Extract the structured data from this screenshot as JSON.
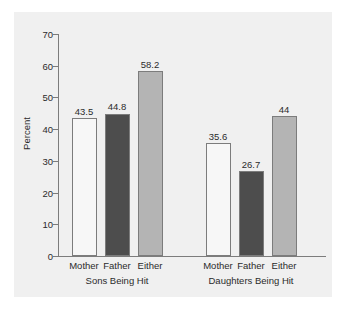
{
  "chart_data": {
    "type": "bar",
    "title": "",
    "subtitle": "",
    "xlabel": "",
    "ylabel": "Percent",
    "ylim": [
      0,
      70
    ],
    "ytick_values": [
      0,
      10,
      20,
      30,
      40,
      50,
      60,
      70
    ],
    "ytick_labels": [
      "0",
      "10",
      "20",
      "30",
      "40",
      "50",
      "60",
      "70"
    ],
    "grid": false,
    "legend": "none",
    "categories": [
      "Mother",
      "Father",
      "Either"
    ],
    "groups": [
      "Sons Being Hit",
      "Daughters Being Hit"
    ],
    "series": [
      {
        "name": "Sons Being Hit",
        "values": [
          43.5,
          44.8,
          58.2
        ],
        "value_labels": [
          "43.5",
          "44.8",
          "58.2"
        ]
      },
      {
        "name": "Daughters Being Hit",
        "values": [
          35.6,
          26.7,
          44
        ],
        "value_labels": [
          "35.6",
          "26.7",
          "44"
        ]
      }
    ],
    "colors": {
      "mother": "#f7f7f7",
      "father": "#4d4d4d",
      "either": "#b4b4b4",
      "bar_edge": "#7c7c7c",
      "axis": "#7c7c7c",
      "panel_background": "#f0f0f0",
      "page_background": "#ffffff",
      "text": "#2b2b2b"
    },
    "bars": [
      {
        "group": "Sons Being Hit",
        "category": "Mother",
        "value": 43.5,
        "label": "43.5",
        "fill": "mother"
      },
      {
        "group": "Sons Being Hit",
        "category": "Father",
        "value": 44.8,
        "label": "44.8",
        "fill": "father"
      },
      {
        "group": "Sons Being Hit",
        "category": "Either",
        "value": 58.2,
        "label": "58.2",
        "fill": "either"
      },
      {
        "group": "Daughters Being Hit",
        "category": "Mother",
        "value": 35.6,
        "label": "35.6",
        "fill": "mother"
      },
      {
        "group": "Daughters Being Hit",
        "category": "Father",
        "value": 26.7,
        "label": "26.7",
        "fill": "father"
      },
      {
        "group": "Daughters Being Hit",
        "category": "Either",
        "value": 44,
        "label": "44",
        "fill": "either"
      }
    ]
  }
}
